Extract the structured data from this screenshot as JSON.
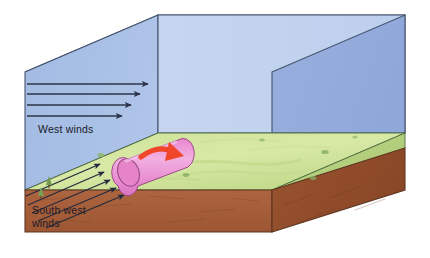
{
  "figure": {
    "background_color": "#ffffff"
  },
  "labels": {
    "west_winds": "West winds",
    "south_west_winds_line1": "South west",
    "south_west_winds_line2": "winds"
  },
  "colors": {
    "sky_front_left": "#a8bfe4",
    "sky_front_right": "#c3d4ef",
    "sky_top": "#b7c8ea",
    "sky_right_side": "#93abdd",
    "ground_green": "#c6dd8e",
    "ground_green_right": "#b2cf80",
    "soil_brown": "#a85f3a",
    "soil_brown_side": "#8d4b2c",
    "vortex_pink": "#e88fd0",
    "vortex_pink_light": "#f0a9dc",
    "vortex_end_cap": "#e07fc8",
    "rotation_arrow_red": "#f0462a",
    "wind_arrow": "#2d3348",
    "outline": "#43506b",
    "tree_green": "#7fa85c",
    "bush_green": "#8fb86a"
  },
  "geometry": {
    "box_note": "Isometric block: left-front sky face, right-front sky face, sky top face, right side face, green ground surface, brown soil slab",
    "back_top_left": [
      25,
      72
    ],
    "back_top_apex": [
      158,
      15
    ],
    "top_right_apex": [
      405,
      15
    ],
    "front_left_bottom": [
      25,
      232
    ],
    "front_corner_bottom": [
      310,
      232
    ]
  },
  "elements": {
    "west_wind_arrows": {
      "name": "west-winds-arrow-group",
      "count": 4,
      "direction": "horizontal eastward",
      "description": "Four straight horizontal arrows pointing right, stacked vertically with decreasing length downward"
    },
    "south_west_wind_arrows": {
      "name": "south-west-winds-arrow-group",
      "count": 5,
      "direction": "diagonal up-right along ground surface",
      "description": "Five parallel arrows angled up and to the right across the green ground plane"
    },
    "roll_vortex": {
      "name": "roll-vortex-cylinder",
      "shape": "cylinder",
      "orientation": "horizontal, aligned with wind, tilted in perspective",
      "rotation_arrow": "curved red arrow over the cylinder top indicating rotation"
    },
    "vegetation": {
      "tree_count": 2,
      "bush_count": 5,
      "description": "Small dark-green trees near the left edge and scattered small bushes across the ground"
    }
  }
}
